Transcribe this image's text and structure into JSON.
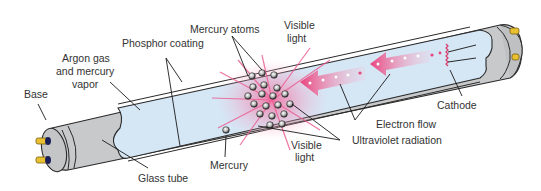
{
  "labels": {
    "base": "Base",
    "argon_line1": "Argon gas",
    "argon_line2": "and mercury",
    "argon_line3": "vapor",
    "phosphor": "Phosphor coating",
    "mercury_atoms": "Mercury atoms",
    "visible_top_line1": "Visible",
    "visible_top_line2": "light",
    "cathode": "Cathode",
    "electron_flow": "Electron flow",
    "ultraviolet": "Ultraviolet radiation",
    "visible_bottom_line1": "Visible",
    "visible_bottom_line2": "light",
    "mercury": "Mercury",
    "glass_tube": "Glass tube"
  },
  "colors": {
    "tube_gray": "#c8c9cb",
    "inner_blue": "#d5e6f5",
    "pink": "#e8457f",
    "pin_gold": "#e8c030",
    "outline": "#2a2a2a"
  }
}
